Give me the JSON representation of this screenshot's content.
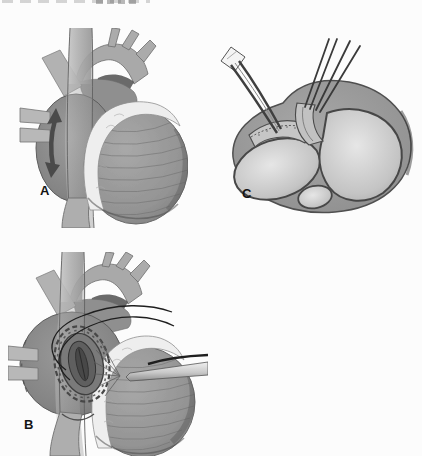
{
  "figure": {
    "type": "medical-illustration-three-panel",
    "panels": [
      {
        "label": "A",
        "name": "external-heart-enlarged-right-atrium-with-incision-arrow"
      },
      {
        "label": "B",
        "name": "right-atriotomy-purse-string-suture-with-cannula"
      },
      {
        "label": "C",
        "name": "heart-cross-section-with-forceps-and-retraction-sutures"
      }
    ],
    "colors": {
      "background": "#fcfcfc",
      "heart_gray": "#8f8f8f",
      "atrium_gray": "#858585",
      "vessel_gray": "#b3b3b3",
      "epicardial_fat_white": "#eeeeee",
      "chamber_light": "#e2e2e2",
      "outline_dark": "#4a4a4a",
      "suture_dark": "#1e1e1e",
      "label_color": "#141414"
    }
  }
}
